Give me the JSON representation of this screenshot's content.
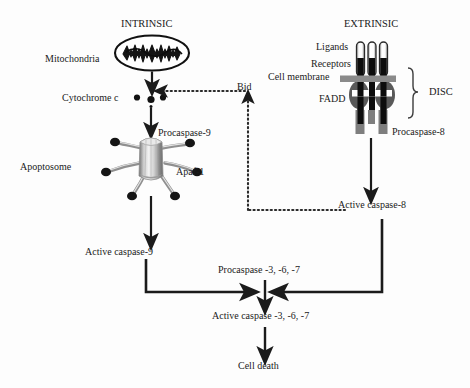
{
  "diagram": {
    "background_color": "#fdfdfd",
    "line_color": "#1b1b1b",
    "headings": {
      "intrinsic": "INTRINSIC",
      "extrinsic": "EXTRINSIC"
    },
    "intrinsic_pathway": {
      "mitochondria_label": "Mitochondria",
      "cytochrome_c_label": "Cytochrome c",
      "apoptosome_label": "Apoptosome",
      "procaspase9_label": "Procaspase-9",
      "apaf1_label": "Apaf-1",
      "active_caspase9_label": "Active caspase-9"
    },
    "extrinsic_pathway": {
      "ligands_label": "Ligands",
      "receptors_label": "Receptors",
      "cell_membrane_label": "Cell membrane",
      "fadd_label": "FADD",
      "disc_label": "DISC",
      "procaspase8_label": "Procaspase-8",
      "active_caspase8_label": "Active caspase-8"
    },
    "crosstalk": {
      "bid_label": "Bid"
    },
    "execution_pathway": {
      "procaspase_367_label": "Procaspase -3, -6, -7",
      "active_caspase_367_label": "Active caspase -3, -6, -7",
      "cell_death_label": "Cell death"
    }
  }
}
